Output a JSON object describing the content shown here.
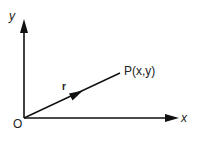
{
  "diagram": {
    "type": "position-vector",
    "labels": {
      "y_axis": "y",
      "x_axis": "x",
      "origin": "O",
      "vector": "r",
      "point": "P(x,y)"
    },
    "colors": {
      "stroke": "#111111",
      "text": "#222222",
      "background": "#ffffff"
    }
  }
}
